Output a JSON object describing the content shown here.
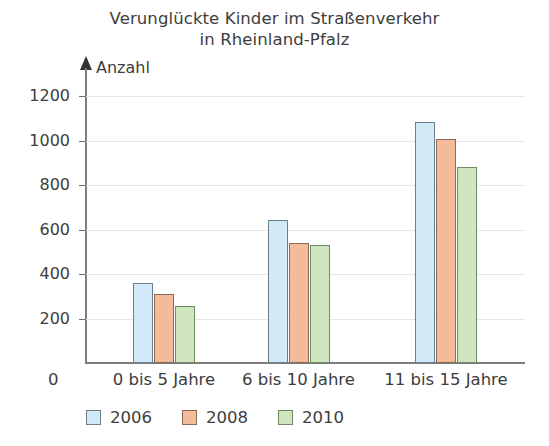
{
  "chart_data": {
    "type": "bar",
    "title": "Verunglückte Kinder im Straßenverkehr in Rheinland-Pfalz",
    "title_line1": "Verunglückte Kinder im Straßenverkehr",
    "title_line2": "in Rheinland-Pfalz",
    "xlabel": "",
    "ylabel": "Anzahl",
    "origin_label": "0",
    "ylim": [
      0,
      1300
    ],
    "yticks": [
      200,
      400,
      600,
      800,
      1000,
      1200
    ],
    "ytick_labels": [
      "200",
      "400",
      "600",
      "800",
      "1000",
      "1200"
    ],
    "grid": true,
    "legend_position": "bottom-left",
    "categories": [
      "0 bis 5 Jahre",
      "6 bis 10 Jahre",
      "11 bis 15 Jahre"
    ],
    "series": [
      {
        "name": "2006",
        "color": "#d2eaf7",
        "border_color": "#6b7f8a",
        "values": [
          360,
          645,
          1085
        ]
      },
      {
        "name": "2008",
        "color": "#f4bb99",
        "border_color": "#8a6b5a",
        "values": [
          310,
          540,
          1005
        ]
      },
      {
        "name": "2010",
        "color": "#cfe6c0",
        "border_color": "#6f8a63",
        "values": [
          258,
          530,
          880
        ]
      }
    ]
  },
  "legend": {
    "items": [
      {
        "label": "2006",
        "color": "#d2eaf7"
      },
      {
        "label": "2008",
        "color": "#f4bb99"
      },
      {
        "label": "2010",
        "color": "#cfe6c0"
      }
    ]
  }
}
